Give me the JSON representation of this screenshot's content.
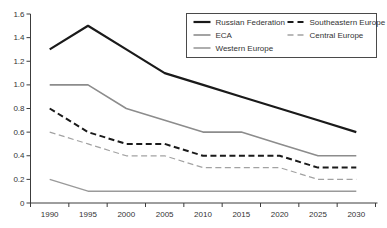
{
  "chart_data": {
    "type": "line",
    "title": "",
    "xlabel": "",
    "ylabel": "",
    "x_categories": [
      "1990",
      "1995",
      "2000",
      "2005",
      "2010",
      "2015",
      "2020",
      "2025",
      "2030"
    ],
    "series": [
      {
        "name": "Russian Federation",
        "values": [
          1.3,
          1.5,
          1.3,
          1.1,
          1.0,
          0.9,
          0.8,
          0.7,
          0.6
        ],
        "color": "#1a1a1a",
        "style": "solid",
        "width": 2.2
      },
      {
        "name": "ECA",
        "values": [
          1.0,
          1.0,
          0.8,
          0.7,
          0.6,
          0.6,
          0.5,
          0.4,
          0.4
        ],
        "color": "#8c8c8c",
        "style": "solid",
        "width": 1.6
      },
      {
        "name": "Western Europe",
        "values": [
          0.2,
          0.1,
          0.1,
          0.1,
          0.1,
          0.1,
          0.1,
          0.1,
          0.1
        ],
        "color": "#9a9a9a",
        "style": "solid",
        "width": 1.4
      },
      {
        "name": "Southeastern Europe",
        "values": [
          0.8,
          0.6,
          0.5,
          0.5,
          0.4,
          0.4,
          0.4,
          0.3,
          0.3
        ],
        "color": "#1a1a1a",
        "style": "dashed",
        "width": 2.0
      },
      {
        "name": "Central Europe",
        "values": [
          0.6,
          0.5,
          0.4,
          0.4,
          0.3,
          0.3,
          0.3,
          0.2,
          0.2
        ],
        "color": "#a2a2a2",
        "style": "dashed",
        "width": 1.2
      }
    ],
    "y_ticks": [
      "0",
      "0.2",
      "0.4",
      "0.6",
      "0.8",
      "1.0",
      "1.2",
      "1.4",
      "1.6"
    ],
    "ylim": [
      0,
      1.6
    ],
    "grid": false,
    "legend": {
      "position": "top-right",
      "columns": [
        [
          "Russian Federation",
          "ECA",
          "Western Europe"
        ],
        [
          "Southeastern Europe",
          "Central Europe"
        ]
      ]
    },
    "axis_color": "#3c3c3c",
    "legend_border_color": "#4a4a4a"
  }
}
